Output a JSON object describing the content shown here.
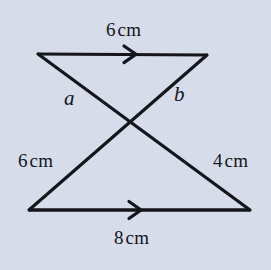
{
  "figure": {
    "background_color": "#d6dce9",
    "stroke_color": "#15161c",
    "stroke_width": 3,
    "labels": {
      "top_length": {
        "value": "6",
        "unit": "cm"
      },
      "left_length": {
        "value": "6",
        "unit": "cm"
      },
      "right_length": {
        "value": "4",
        "unit": "cm"
      },
      "bottom_length": {
        "value": "8",
        "unit": "cm"
      },
      "side_a": "a",
      "side_b": "b"
    },
    "vertices": {
      "top_left": {
        "x": 38,
        "y": 54
      },
      "top_right": {
        "x": 207,
        "y": 55
      },
      "bottom_left": {
        "x": 29,
        "y": 210
      },
      "bottom_right": {
        "x": 250,
        "y": 210
      },
      "intersection": {
        "x": 131,
        "y": 122
      }
    },
    "segments": [
      {
        "name": "top-side",
        "from": "top_left",
        "to": "top_right",
        "length_label": "6 cm",
        "arrow_marker": true
      },
      {
        "name": "bottom-side",
        "from": "bottom_left",
        "to": "bottom_right",
        "length_label": "8 cm",
        "arrow_marker": true
      },
      {
        "name": "left-diagonal",
        "from": "top_left",
        "to": "bottom_right",
        "length_label": "a",
        "arrow_marker": false
      },
      {
        "name": "right-diagonal",
        "from": "top_right",
        "to": "bottom_left",
        "length_label": "b",
        "arrow_marker": false
      }
    ],
    "arrow_markers": [
      {
        "name": "top-arrow",
        "x": 134,
        "y": 54
      },
      {
        "name": "bottom-arrow",
        "x": 139,
        "y": 210
      }
    ]
  }
}
